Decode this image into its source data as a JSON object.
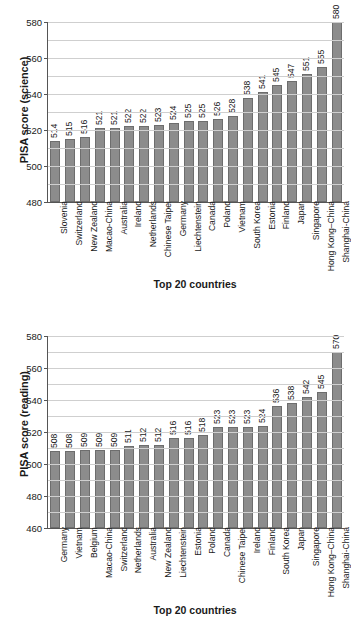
{
  "chart_data": [
    {
      "type": "bar",
      "title": "",
      "xlabel": "Top 20 countries",
      "ylabel": "PISA score (science)",
      "ylim": [
        480,
        580
      ],
      "ytick_step": 20,
      "gridline_step": 10,
      "grid": true,
      "legend": "none",
      "bar_color": "#8c8c8c",
      "yticks": [
        "480",
        "500",
        "520",
        "540",
        "560",
        "580"
      ],
      "categories": [
        "Slovenia",
        "Switzerland",
        "New Zealand",
        "Macao-China",
        "Australia",
        "Ireland",
        "Netherlands",
        "Chinese Taipei",
        "Germany",
        "Liechtenstein",
        "Canada",
        "Poland",
        "Vietnam",
        "South Korea",
        "Estonia",
        "Finland",
        "Japan",
        "Singapore",
        "Hong Kong–China",
        "Shanghai-China"
      ],
      "values": [
        514,
        515,
        516,
        521,
        521,
        522,
        522,
        523,
        524,
        525,
        525,
        526,
        528,
        538,
        541,
        545,
        547,
        551,
        555,
        580
      ]
    },
    {
      "type": "bar",
      "title": "",
      "xlabel": "Top 20 countries",
      "ylabel": "PISA score (reading)",
      "ylim": [
        460,
        580
      ],
      "ytick_step": 20,
      "gridline_step": 10,
      "grid": true,
      "legend": "none",
      "bar_color": "#8c8c8c",
      "yticks": [
        "460",
        "480",
        "500",
        "520",
        "540",
        "560",
        "580"
      ],
      "categories": [
        "Germany",
        "Vietnam",
        "Belgium",
        "Macao-China",
        "Switzerland",
        "Netherlands",
        "Australia",
        "New Zealand",
        "Liechtenstein",
        "Estonia",
        "Poland",
        "Canada",
        "Chinese Taipei",
        "Ireland",
        "Finland",
        "South Korea",
        "Japan",
        "Singapore",
        "Hong Kong–China",
        "Shanghai-China"
      ],
      "values": [
        508,
        508,
        509,
        509,
        509,
        511,
        512,
        512,
        516,
        516,
        518,
        523,
        523,
        523,
        524,
        536,
        538,
        542,
        545,
        570
      ]
    }
  ]
}
